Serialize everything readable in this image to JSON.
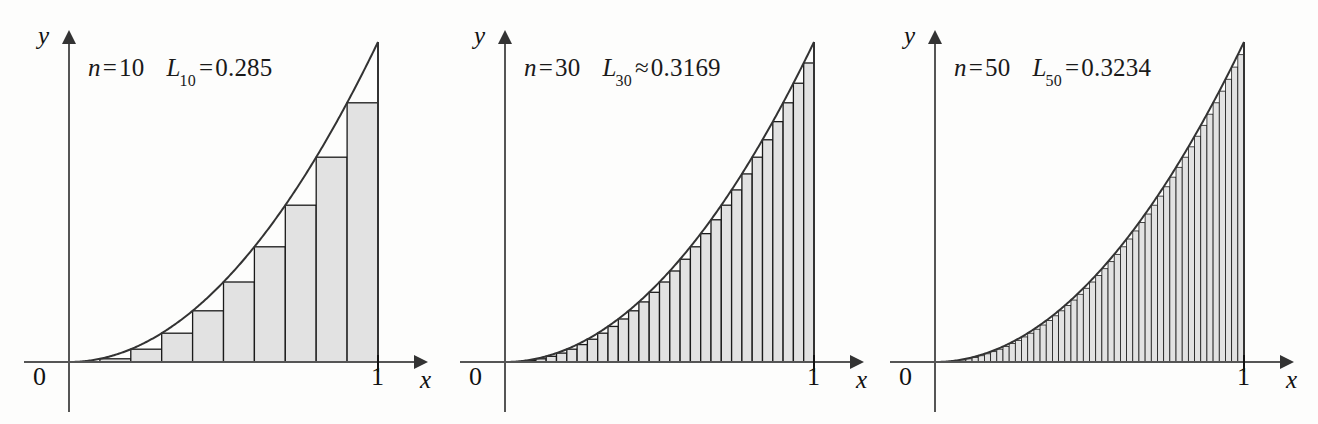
{
  "figure": {
    "background_color": "#fdfdfc",
    "ink_color": "#1a1a1a",
    "bar_fill_color": "#e2e2e2",
    "bar_stroke_color": "#1a1a1a",
    "curve_color": "#333333"
  },
  "panels": [
    {
      "id": "panel-n10",
      "n_symbol": "n",
      "n_equals": "=",
      "n_value": "10",
      "sum_symbol": "L",
      "sum_subscript": "10",
      "sum_relation": "=",
      "sum_value": "0.285",
      "label_text": "n = 10   L10 = 0.285",
      "y_axis_label": "y",
      "x_axis_label": "x",
      "origin_label": "0",
      "right_tick_label": "1"
    },
    {
      "id": "panel-n30",
      "n_symbol": "n",
      "n_equals": "=",
      "n_value": "30",
      "sum_symbol": "L",
      "sum_subscript": "30",
      "sum_relation": "≈",
      "sum_value": "0.3169",
      "label_text": "n = 30   L30 ≈ 0.3169",
      "y_axis_label": "y",
      "x_axis_label": "x",
      "origin_label": "0",
      "right_tick_label": "1"
    },
    {
      "id": "panel-n50",
      "n_symbol": "n",
      "n_equals": "=",
      "n_value": "50",
      "sum_symbol": "L",
      "sum_subscript": "50",
      "sum_relation": "=",
      "sum_value": "0.3234",
      "label_text": "n = 50   L50 = 0.3234",
      "y_axis_label": "y",
      "x_axis_label": "x",
      "origin_label": "0",
      "right_tick_label": "1"
    }
  ],
  "chart_data": [
    {
      "type": "bar",
      "title": "n = 10   L10 = 0.285",
      "xlabel": "x",
      "ylabel": "y",
      "xlim": [
        0,
        1
      ],
      "ylim": [
        0,
        1
      ],
      "grid": false,
      "legend": "none",
      "function": "y = x^2",
      "riemann": "left endpoint (lower) sum",
      "n": 10,
      "sum_label": "L10",
      "sum_value": 0.285,
      "x_ticks": [
        0,
        1
      ],
      "x_tick_labels": [
        "0",
        "1"
      ],
      "bar_left_edges": [
        0.0,
        0.1,
        0.2,
        0.3,
        0.4,
        0.5,
        0.6,
        0.7,
        0.8,
        0.9
      ],
      "bar_width": 0.1,
      "values": [
        0.0,
        0.01,
        0.04,
        0.09,
        0.16,
        0.25,
        0.36,
        0.49,
        0.64,
        0.81
      ],
      "curve_x": [
        0.0,
        0.1,
        0.2,
        0.3,
        0.4,
        0.5,
        0.6,
        0.7,
        0.8,
        0.9,
        1.0
      ],
      "curve_y": [
        0.0,
        0.01,
        0.04,
        0.09,
        0.16,
        0.25,
        0.36,
        0.49,
        0.64,
        0.81,
        1.0
      ]
    },
    {
      "type": "bar",
      "title": "n = 30   L30 ≈ 0.3169",
      "xlabel": "x",
      "ylabel": "y",
      "xlim": [
        0,
        1
      ],
      "ylim": [
        0,
        1
      ],
      "grid": false,
      "legend": "none",
      "function": "y = x^2",
      "riemann": "left endpoint (lower) sum",
      "n": 30,
      "sum_label": "L30",
      "sum_value": 0.3169,
      "x_ticks": [
        0,
        1
      ],
      "x_tick_labels": [
        "0",
        "1"
      ],
      "bar_width": 0.0333333
    },
    {
      "type": "bar",
      "title": "n = 50   L50 = 0.3234",
      "xlabel": "x",
      "ylabel": "y",
      "xlim": [
        0,
        1
      ],
      "ylim": [
        0,
        1
      ],
      "grid": false,
      "legend": "none",
      "function": "y = x^2",
      "riemann": "left endpoint (lower) sum",
      "n": 50,
      "sum_label": "L50",
      "sum_value": 0.3234,
      "x_ticks": [
        0,
        1
      ],
      "x_tick_labels": [
        "0",
        "1"
      ],
      "bar_width": 0.02
    }
  ]
}
